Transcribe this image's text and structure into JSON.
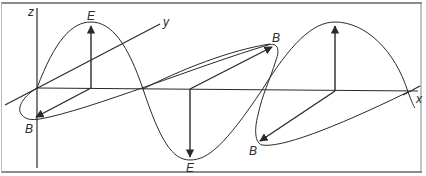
{
  "diagram": {
    "type": "electromagnetic-wave",
    "axes": {
      "x_label": "x",
      "y_label": "y",
      "z_label": "z"
    },
    "field_labels": {
      "electric": "E",
      "magnetic": "B"
    },
    "labels": [
      {
        "id": "e1",
        "text": "E"
      },
      {
        "id": "e2",
        "text": "E"
      },
      {
        "id": "b1",
        "text": "B"
      },
      {
        "id": "b2",
        "text": "B"
      },
      {
        "id": "b3",
        "text": "B"
      }
    ],
    "colors": {
      "line": "#2a2a2a",
      "background": "#ffffff",
      "frame": "#555555"
    }
  }
}
